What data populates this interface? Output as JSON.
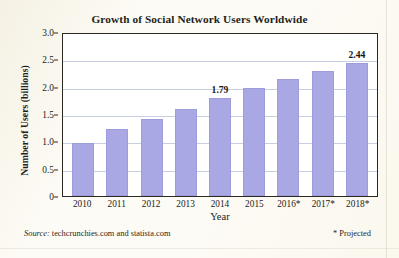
{
  "chart_data": {
    "type": "bar",
    "title": "Growth of Social Network Users Worldwide",
    "xlabel": "Year",
    "ylabel": "Number of Users (billions)",
    "categories": [
      "2010",
      "2011",
      "2012",
      "2013",
      "2014",
      "2015",
      "2016*",
      "2017*",
      "2018*"
    ],
    "values": [
      0.97,
      1.22,
      1.4,
      1.59,
      1.79,
      1.97,
      2.14,
      2.28,
      2.44
    ],
    "point_labels": [
      null,
      null,
      null,
      null,
      "1.79",
      null,
      null,
      null,
      "2.44"
    ],
    "ylim": [
      0,
      3.0
    ],
    "yticks": [
      0,
      0.5,
      1.0,
      1.5,
      2.0,
      2.5,
      3.0
    ],
    "ytick_labels": [
      "0",
      "0.5",
      "1.0",
      "1.5",
      "2.0",
      "2.5",
      "3.0"
    ],
    "grid": true,
    "legend": false,
    "bar_color": "#a9a8e4",
    "grid_color": "#c9cfe2",
    "axis_color": "#2b2722"
  },
  "footer": {
    "source_word": "Source:",
    "source_text": " techcrunchies.com and statista.com",
    "projected_note": "* Projected"
  }
}
